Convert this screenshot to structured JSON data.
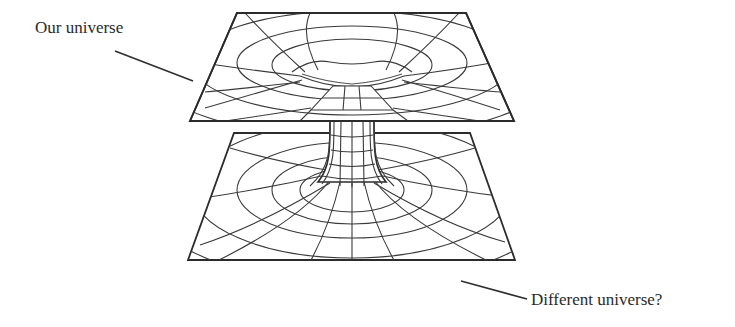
{
  "diagram": {
    "labels": {
      "top": "Our universe",
      "bottom": "Different universe?"
    },
    "colors": {
      "background": "#ffffff",
      "line": "#2b2b2b",
      "text": "#2a2a2a"
    },
    "sheets": [
      {
        "name": "our-universe-sheet",
        "corners": [
          [
            237,
            13
          ],
          [
            466,
            13
          ],
          [
            514,
            121
          ],
          [
            190,
            121
          ]
        ]
      },
      {
        "name": "different-universe-sheet",
        "corners": [
          [
            234,
            133
          ],
          [
            470,
            133
          ],
          [
            515,
            260
          ],
          [
            188,
            260
          ]
        ]
      }
    ],
    "throat": {
      "center_x": 352,
      "top_y": 86,
      "bottom_y": 205,
      "neck_half_width": 22
    }
  }
}
